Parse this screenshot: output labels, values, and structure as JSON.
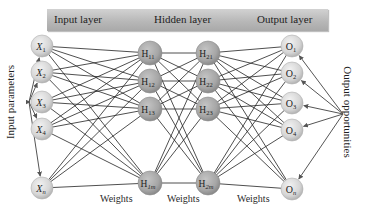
{
  "header": {
    "input_layer": "Input layer",
    "hidden_layer": "Hidden layer",
    "output_layer": "Output layer"
  },
  "side_labels": {
    "input": "Input parameters",
    "output": "Output opportunities"
  },
  "weights_labels": [
    "Weights",
    "Weights",
    "Weights"
  ],
  "colors": {
    "io_node": "#d9d9d9",
    "hidden_node": "#a9a9a9",
    "edge": "#222222",
    "arrow": "#555555"
  },
  "layers": {
    "input": {
      "x": 42,
      "nodes": [
        {
          "main": "X",
          "sub": "1",
          "y": 46,
          "italic": true
        },
        {
          "main": "X",
          "sub": "2",
          "y": 72,
          "italic": true
        },
        {
          "main": "X",
          "sub": "3",
          "y": 102,
          "italic": true
        },
        {
          "main": "X",
          "sub": "4",
          "y": 129,
          "italic": true
        },
        {
          "main": "X",
          "sub": "n",
          "y": 188,
          "italic": true
        }
      ]
    },
    "hidden1": {
      "x": 150,
      "nodes": [
        {
          "main": "H",
          "sub": "11",
          "y": 53
        },
        {
          "main": "H",
          "sub": "12",
          "y": 81
        },
        {
          "main": "H",
          "sub": "13",
          "y": 109
        },
        {
          "main": "H",
          "sub": "1m",
          "y": 183
        }
      ]
    },
    "hidden2": {
      "x": 208,
      "nodes": [
        {
          "main": "H",
          "sub": "21",
          "y": 53
        },
        {
          "main": "H",
          "sub": "22",
          "y": 81
        },
        {
          "main": "H",
          "sub": "23",
          "y": 109
        },
        {
          "main": "H",
          "sub": "2m",
          "y": 183
        }
      ]
    },
    "output": {
      "x": 292,
      "nodes": [
        {
          "main": "O",
          "sub": "1",
          "y": 46
        },
        {
          "main": "O",
          "sub": "2",
          "y": 73
        },
        {
          "main": "O",
          "sub": "3",
          "y": 103
        },
        {
          "main": "O",
          "sub": "4",
          "y": 130
        },
        {
          "main": "O",
          "sub": "n",
          "y": 189
        }
      ]
    }
  },
  "arrow_sources": {
    "input": {
      "x": 29,
      "y": 102
    },
    "output": {
      "x": 343,
      "y": 114
    }
  }
}
